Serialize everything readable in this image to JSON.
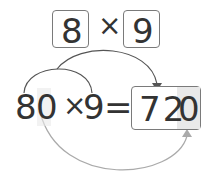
{
  "top_factors": {
    "left": "8",
    "operator": "×",
    "right": "9"
  },
  "equation": {
    "left_operand_tens": "8",
    "left_operand_zero": "0",
    "operator": "×",
    "right_operand": "9",
    "equals": "=",
    "result_digits": "72",
    "result_zero": "0"
  },
  "colors": {
    "stroke_dark": "#555555",
    "stroke_light": "#9a9a9a",
    "shade": "#e9e9e9",
    "text": "#333333"
  }
}
